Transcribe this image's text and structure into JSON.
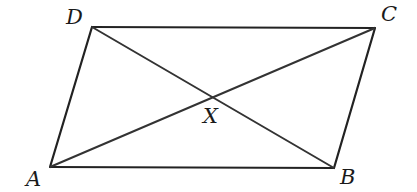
{
  "diagram": {
    "type": "parallelogram-with-diagonals",
    "vertices": {
      "A": {
        "label": "A",
        "x": 50,
        "y": 167
      },
      "B": {
        "label": "B",
        "x": 334,
        "y": 168
      },
      "C": {
        "label": "C",
        "x": 375,
        "y": 28
      },
      "D": {
        "label": "D",
        "x": 92,
        "y": 27
      }
    },
    "intersection": {
      "label": "X",
      "x": 212,
      "y": 97
    },
    "edges": [
      [
        "A",
        "B"
      ],
      [
        "B",
        "C"
      ],
      [
        "C",
        "D"
      ],
      [
        "D",
        "A"
      ]
    ],
    "diagonals": [
      [
        "A",
        "C"
      ],
      [
        "D",
        "B"
      ]
    ],
    "colors": {
      "stroke": "#222222",
      "text": "#1a1a1a",
      "background": "#ffffff"
    }
  }
}
